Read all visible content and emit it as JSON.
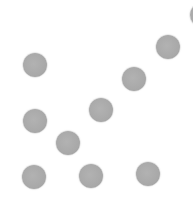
{
  "canvas": {
    "width": 193,
    "height": 198,
    "background": "#ffffff"
  },
  "dot_style": {
    "color": "#a8a8a8",
    "radius": 12
  },
  "dots": [
    {
      "id": "dot-1",
      "cx": 35,
      "cy": 65
    },
    {
      "id": "dot-2",
      "cx": 35,
      "cy": 121
    },
    {
      "id": "dot-3",
      "cx": 34,
      "cy": 177
    },
    {
      "id": "dot-4",
      "cx": 68,
      "cy": 143
    },
    {
      "id": "dot-5",
      "cx": 91,
      "cy": 176
    },
    {
      "id": "dot-6",
      "cx": 101,
      "cy": 110
    },
    {
      "id": "dot-7",
      "cx": 134,
      "cy": 79
    },
    {
      "id": "dot-8",
      "cx": 148,
      "cy": 174
    },
    {
      "id": "dot-9",
      "cx": 168,
      "cy": 47
    },
    {
      "id": "dot-10",
      "cx": 202,
      "cy": 15
    }
  ]
}
